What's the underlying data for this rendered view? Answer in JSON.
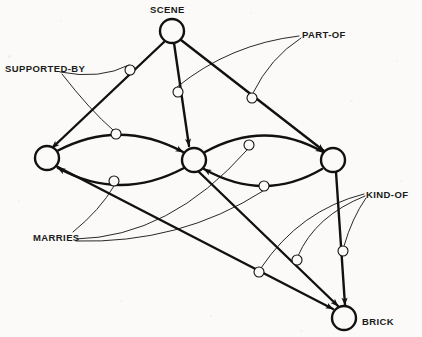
{
  "diagram": {
    "type": "node-link-graph",
    "background_color": "#fbfaf8",
    "line_color": "#111111",
    "nodes": [
      {
        "id": "scene",
        "label": "SCENE",
        "cx": 172,
        "cy": 31,
        "r": 12,
        "label_x": 150,
        "label_y": 5,
        "labeled": true
      },
      {
        "id": "n_left",
        "label": "",
        "cx": 47,
        "cy": 158,
        "r": 12,
        "label_x": 0,
        "label_y": 0,
        "labeled": false
      },
      {
        "id": "n_mid",
        "label": "",
        "cx": 194,
        "cy": 160,
        "r": 12,
        "label_x": 0,
        "label_y": 0,
        "labeled": false
      },
      {
        "id": "n_right",
        "label": "",
        "cx": 333,
        "cy": 160,
        "r": 12,
        "label_x": 0,
        "label_y": 0,
        "labeled": false
      },
      {
        "id": "brick",
        "label": "BRICK",
        "cx": 344,
        "cy": 318,
        "r": 12,
        "label_x": 362,
        "label_y": 317,
        "labeled": true
      }
    ],
    "relation_labels": [
      {
        "id": "part-of",
        "text": "PART-OF",
        "x": 302,
        "y": 30
      },
      {
        "id": "supported-by",
        "text": "SUPPORTED-BY",
        "x": 5,
        "y": 64
      },
      {
        "id": "kind-of",
        "text": "KIND-OF",
        "x": 366,
        "y": 190
      },
      {
        "id": "marries",
        "text": "MARRIES",
        "x": 33,
        "y": 233
      }
    ],
    "relation_markers": [
      {
        "id": "m1",
        "cx": 130,
        "cy": 70,
        "r": 5.0,
        "relation": "supported-by"
      },
      {
        "id": "m2",
        "cx": 178,
        "cy": 92,
        "r": 5.0,
        "relation": "part-of"
      },
      {
        "id": "m3",
        "cx": 252,
        "cy": 98,
        "r": 5.0,
        "relation": "part-of"
      },
      {
        "id": "m4",
        "cx": 116,
        "cy": 134,
        "r": 5.0,
        "relation": "marries"
      },
      {
        "id": "m5",
        "cx": 249,
        "cy": 145,
        "r": 5.0,
        "relation": "marries"
      },
      {
        "id": "m6",
        "cx": 114,
        "cy": 181,
        "r": 5.0,
        "relation": "marries"
      },
      {
        "id": "m7",
        "cx": 264,
        "cy": 186,
        "r": 5.0,
        "relation": "marries"
      },
      {
        "id": "m8",
        "cx": 259,
        "cy": 272,
        "r": 5.0,
        "relation": "kind-of"
      },
      {
        "id": "m9",
        "cx": 297,
        "cy": 260,
        "r": 5.0,
        "relation": "kind-of"
      },
      {
        "id": "m10",
        "cx": 343,
        "cy": 251,
        "r": 5.0,
        "relation": "kind-of"
      }
    ],
    "thick_edges": [
      {
        "id": "e-scene-left",
        "d": "M 164 42 L 52 148",
        "arrow_at": [
          52,
          148
        ],
        "arrow_angle": 137
      },
      {
        "id": "e-scene-mid",
        "d": "M 174 43 L 189 146",
        "arrow_at": [
          189,
          146
        ],
        "arrow_angle": 82
      },
      {
        "id": "e-scene-right",
        "d": "M 181 40 L 324 151",
        "arrow_at": [
          324,
          151
        ],
        "arrow_angle": 38
      },
      {
        "id": "e-left-mid-top",
        "d": "M 57 151 Q 120 118 183 152",
        "arrow_at": [
          183,
          152
        ],
        "arrow_angle": 30
      },
      {
        "id": "e-mid-left-bottom",
        "d": "M 184 168 Q 120 202 58 168",
        "arrow_at": [
          58,
          168
        ],
        "arrow_angle": 208
      },
      {
        "id": "e-mid-right-top",
        "d": "M 205 152 Q 265 119 323 152",
        "arrow_at": [
          323,
          152
        ],
        "arrow_angle": 30
      },
      {
        "id": "e-right-mid-bottom",
        "d": "M 322 169 Q 264 203 204 169",
        "arrow_at": [
          204,
          169
        ],
        "arrow_angle": 209
      },
      {
        "id": "e-left-brick",
        "d": "M 56 166 L 333 309",
        "arrow_at": [
          333,
          309
        ],
        "arrow_angle": 27
      },
      {
        "id": "e-mid-brick",
        "d": "M 199 172 L 338 306",
        "arrow_at": [
          338,
          306
        ],
        "arrow_angle": 44
      },
      {
        "id": "e-right-brick",
        "d": "M 336 172 L 345 305",
        "arrow_at": [
          345,
          305
        ],
        "arrow_angle": 86
      }
    ],
    "thin_edges": [
      {
        "id": "t-supportedby-m1",
        "d": "M 60 72 Q 100 80 129 65"
      },
      {
        "id": "t-supportedby-m4",
        "d": "M 62 74 Q 90 110 113 130"
      },
      {
        "id": "t-partof-m2",
        "d": "M 299 36 Q 230 44 177 87"
      },
      {
        "id": "t-partof-m3",
        "d": "M 301 38 Q 270 58 253 93"
      },
      {
        "id": "t-marries-m6",
        "d": "M 73 232 Q 100 210 114 186"
      },
      {
        "id": "t-marries-m5",
        "d": "M 76 239 Q 170 237 247 150"
      },
      {
        "id": "t-marries-m7",
        "d": "M 76 241 Q 180 244 263 191"
      },
      {
        "id": "t-kindof-m8",
        "d": "M 364 194 Q 300 210 261 268"
      },
      {
        "id": "t-kindof-m9",
        "d": "M 365 196 Q 315 216 298 256"
      },
      {
        "id": "t-kindof-m10",
        "d": "M 366 198 Q 352 218 344 246"
      }
    ]
  }
}
